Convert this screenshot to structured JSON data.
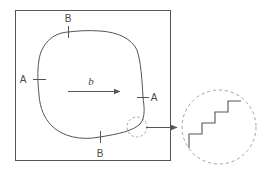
{
  "figure": {
    "type": "schematic-diagram",
    "background_color": "#ffffff",
    "line_color": "#555555",
    "text_color": "#4a4a4a",
    "dashed_color": "#999999"
  },
  "frame": {
    "name": "outer-square-frame",
    "x": 15,
    "y": 10,
    "width": 155,
    "height": 150,
    "stroke": "#555555",
    "stroke_width": 1
  },
  "loop": {
    "name": "closed-grain-boundary-curve",
    "stroke": "#555555",
    "fill": "none"
  },
  "markers": [
    {
      "id": "marker-a-left",
      "label": "A",
      "label_x": 23,
      "label_y": 83,
      "tick_x": 39,
      "tick_y": 79,
      "orientation": "horizontal"
    },
    {
      "id": "marker-a-right",
      "label": "A",
      "label_x": 150,
      "label_y": 101,
      "tick_x": 143,
      "tick_y": 97,
      "orientation": "horizontal"
    },
    {
      "id": "marker-b-top",
      "label": "B",
      "label_x": 64,
      "label_y": 22,
      "tick_x": 68,
      "tick_y": 32,
      "orientation": "vertical"
    },
    {
      "id": "marker-b-bottom",
      "label": "B",
      "label_x": 96,
      "label_y": 157,
      "tick_x": 100,
      "tick_y": 137,
      "orientation": "vertical"
    }
  ],
  "vector_arrow": {
    "name": "burgers-vector-arrow",
    "label": "b",
    "label_x": 91,
    "label_y": 84,
    "x1": 68,
    "y1": 91,
    "x2": 122,
    "y2": 91
  },
  "callout": {
    "source_circle": {
      "name": "callout-source-circle",
      "cx": 137,
      "cy": 127,
      "r": 10,
      "style": "dashed"
    },
    "connector_arrow": {
      "name": "callout-connector-arrow",
      "x1": 146,
      "y1": 127,
      "x2": 179,
      "y2": 127
    },
    "magnified_circle": {
      "name": "magnified-detail-circle",
      "cx": 219,
      "cy": 127,
      "r": 37,
      "style": "dashed"
    }
  },
  "staircase": {
    "name": "stepped-boundary-staircase",
    "description": "Magnified view of the atomically stepped boundary: a rising staircase of four treads and risers.",
    "step_count": 4,
    "points": "189,148 189,134 202,134 202,123 215,123 215,112 228,112 228,101 241,101"
  }
}
